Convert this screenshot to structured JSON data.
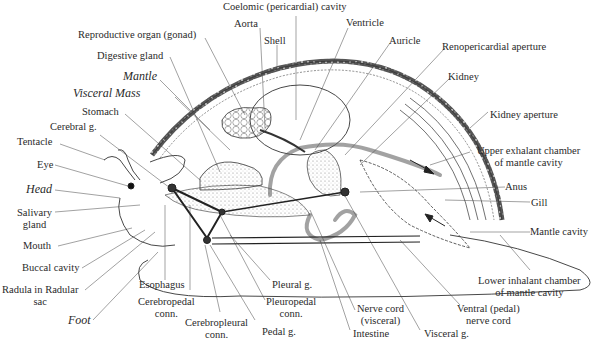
{
  "diagram": {
    "labels": {
      "coelomic_cavity": "Coelomic (pericardial) cavity",
      "aorta": "Aorta",
      "shell": "Shell",
      "ventricle": "Ventricle",
      "auricle": "Auricle",
      "reproductive_organ": "Reproductive organ (gonad)",
      "digestive_gland": "Digestive gland",
      "renopericardial_aperture": "Renopericardial aperture",
      "kidney": "Kidney",
      "mantle": "Mantle",
      "visceral_mass": "Visceral Mass",
      "kidney_aperture": "Kidney aperture",
      "stomach": "Stomach",
      "cerebral_g": "Cerebral g.",
      "tentacle": "Tentacle",
      "upper_exhalant_1": "Upper exhalant chamber",
      "upper_exhalant_2": "of mantle cavity",
      "eye": "Eye",
      "head": "Head",
      "anus": "Anus",
      "salivary_1": "Salivary",
      "salivary_2": "gland",
      "gill": "Gill",
      "mantle_cavity": "Mantle cavity",
      "mouth": "Mouth",
      "buccal_cavity": "Buccal cavity",
      "radula_1": "Radula in Radular",
      "radula_2": "sac",
      "foot": "Foot",
      "esophagus": "Esophagus",
      "cerebropedal_1": "Cerebropedal",
      "cerebropedal_2": "conn.",
      "cerebropleural_1": "Cerebropleural",
      "cerebropleural_2": "conn.",
      "pedal_g": "Pedal g.",
      "pleural_g": "Pleural g.",
      "pleuropedal_1": "Pleuropedal",
      "pleuropedal_2": "conn.",
      "nerve_cord_1": "Nerve cord",
      "nerve_cord_2": "(visceral)",
      "intestine": "Intestine",
      "visceral_g": "Visceral g.",
      "ventral_cord_1": "Ventral (pedal)",
      "ventral_cord_2": "nerve cord",
      "lower_inhalant_1": "Lower inhalant chamber",
      "lower_inhalant_2": "of mantle cavity"
    },
    "colors": {
      "ink": "#2a2a2a",
      "shell_band": "#3a3a3a",
      "stipple": "#bdbdbd",
      "background": "#ffffff"
    }
  }
}
